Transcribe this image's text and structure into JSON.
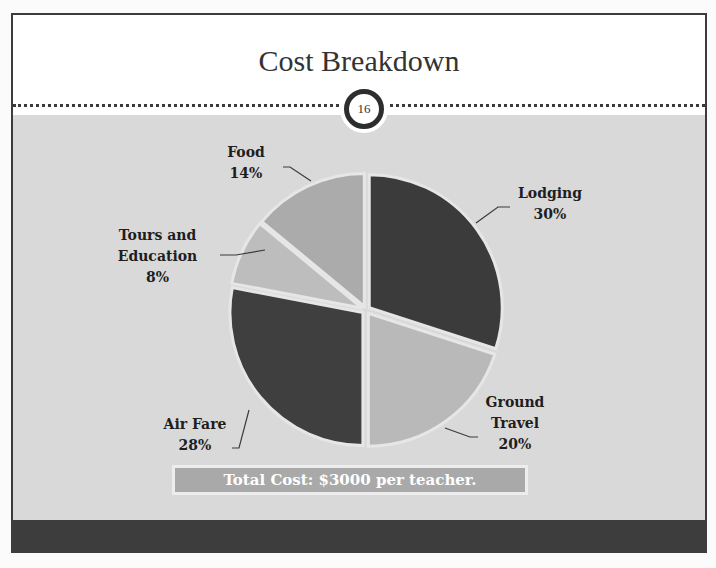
{
  "slide": {
    "title": "Cost Breakdown",
    "page_number": "16",
    "total_cost": "Total Cost: $3000 per teacher."
  },
  "labels": {
    "lodging": {
      "name": "Lodging",
      "pct": "30%"
    },
    "ground": {
      "name1": "Ground",
      "name2": "Travel",
      "pct": "20%"
    },
    "airfare": {
      "name": "Air Fare",
      "pct": "28%"
    },
    "tours": {
      "name1": "Tours and",
      "name2": "Education",
      "pct": "8%"
    },
    "food": {
      "name": "Food",
      "pct": "14%"
    }
  },
  "colors": {
    "lodging": "#3b3b3b",
    "ground_travel": "#b9b9b9",
    "air_fare": "#3f3f3f",
    "tours": "#bdbdbd",
    "food": "#ababab",
    "background": "#d9d9d9",
    "footer": "#3d3d3d"
  },
  "chart_data": {
    "type": "pie",
    "title": "Cost Breakdown",
    "categories": [
      "Lodging",
      "Ground Travel",
      "Air Fare",
      "Tours and Education",
      "Food"
    ],
    "values": [
      30,
      20,
      28,
      8,
      14
    ],
    "unit": "%",
    "start_angle": "12 o'clock, clockwise",
    "annotation": "Total Cost: $3000 per teacher.",
    "legend": "none (data labels with leader lines)"
  }
}
